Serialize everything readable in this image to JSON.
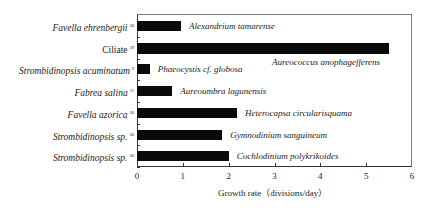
{
  "chart_data": {
    "type": "bar",
    "orientation": "horizontal",
    "title": "",
    "xlabel": "Growth rate（divisions/day）",
    "ylabel": "",
    "xlim": [
      0,
      6
    ],
    "xticks": [
      0,
      1,
      2,
      3,
      4,
      5,
      6
    ],
    "grid": false,
    "legend": null,
    "categories": [
      {
        "predator": "Favella ehrenbergii",
        "ref": "28",
        "italic": true,
        "prey": "Alexandrium tamarense",
        "value": 0.96
      },
      {
        "predator": "Ciliate",
        "ref": "29",
        "italic": false,
        "prey": "Aureococcus anophagefferens",
        "value": 5.5
      },
      {
        "predator": "Strombidinopsis acuminatum",
        "ref": "9",
        "italic": true,
        "prey": "Phaeocystis cf. globosa",
        "value": 0.28
      },
      {
        "predator": "Fabrea salina",
        "ref": "11",
        "italic": true,
        "prey": "Aureoumbra lagunensis",
        "value": 0.77
      },
      {
        "predator": "Favella azorica",
        "ref": "20",
        "italic": true,
        "prey": "Heterocapsa circularisquama",
        "value": 2.18
      },
      {
        "predator": "Strombidinopsis sp.",
        "ref": "30",
        "italic": true,
        "prey": "Gymnodinium sanguineum",
        "value": 1.86
      },
      {
        "predator": "Strombidinopsis sp.",
        "ref": "30",
        "italic": true,
        "prey": "Cochlodinium polykrikoides",
        "value": 2.0
      }
    ],
    "values": [
      0.96,
      5.5,
      0.28,
      0.77,
      2.18,
      1.86,
      2.0
    ],
    "bar_color": "#0a0a0a"
  }
}
